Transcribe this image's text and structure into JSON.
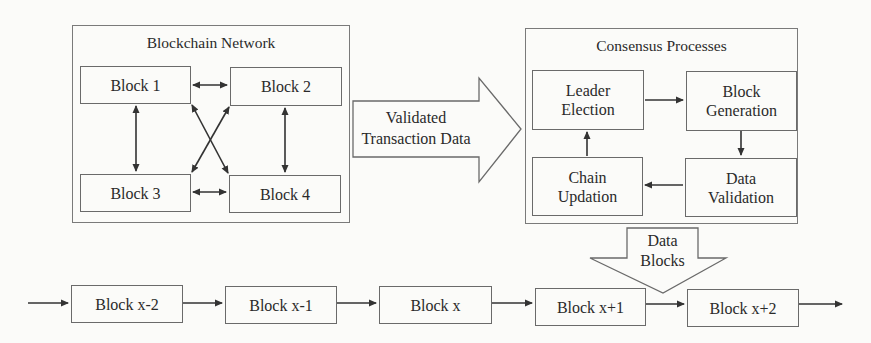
{
  "network": {
    "title": "Blockchain Network",
    "blocks": [
      "Block 1",
      "Block 2",
      "Block 3",
      "Block 4"
    ]
  },
  "transfer_arrow": {
    "line1": "Validated",
    "line2": "Transaction Data"
  },
  "consensus": {
    "title": "Consensus Processes",
    "steps": [
      {
        "line1": "Leader",
        "line2": "Election"
      },
      {
        "line1": "Block",
        "line2": "Generation"
      },
      {
        "line1": "Data",
        "line2": "Validation"
      },
      {
        "line1": "Chain",
        "line2": "Updation"
      }
    ]
  },
  "data_blocks_arrow": {
    "line1": "Data",
    "line2": "Blocks"
  },
  "chain": {
    "blocks": [
      "Block x-2",
      "Block x-1",
      "Block x",
      "Block x+1",
      "Block x+2"
    ]
  },
  "colors": {
    "stroke": "#3a3a3a",
    "border": "#6a6a6a",
    "background": "#fbfbf9"
  }
}
